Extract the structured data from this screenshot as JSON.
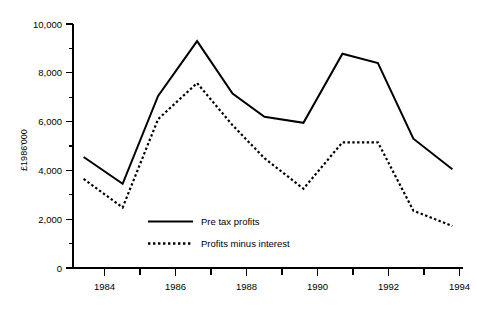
{
  "chart_data": {
    "type": "line",
    "title": "",
    "subtitle": "",
    "xlabel": "",
    "ylabel": "£1986'000",
    "xlim": [
      1983.2,
      1994.2
    ],
    "ylim": [
      0,
      10000
    ],
    "grid": false,
    "legend_position": "inside-lower-left",
    "x_tick_labels": [
      "1984",
      "1986",
      "1988",
      "1990",
      "1992",
      "1994"
    ],
    "x_tick_values": [
      1984,
      1986,
      1988,
      1990,
      1992,
      1994
    ],
    "x_minor_tick_values": [
      1985,
      1987,
      1989,
      1991,
      1993
    ],
    "y_tick_labels": [
      "0",
      "2,000",
      "4,000",
      "6,000",
      "8,000",
      "10,000"
    ],
    "y_tick_values": [
      0,
      2000,
      4000,
      6000,
      8000,
      10000
    ],
    "y_minor_tick_values": [
      1000,
      3000,
      5000,
      7000,
      9000
    ],
    "x": [
      1983.5,
      1984.6,
      1985.6,
      1986.7,
      1987.7,
      1988.6,
      1989.7,
      1990.8,
      1991.8,
      1992.8,
      1993.9
    ],
    "series": [
      {
        "name": "Pre tax profits",
        "style": "solid",
        "values": [
          4550,
          3450,
          7050,
          9300,
          7150,
          6200,
          5950,
          8780,
          8400,
          5300,
          4050
        ]
      },
      {
        "name": "Profits minus interest",
        "style": "dotted",
        "values": [
          3650,
          2480,
          6100,
          7580,
          5850,
          4500,
          3250,
          5150,
          5150,
          2350,
          1720
        ]
      }
    ]
  },
  "legend": {
    "items": [
      {
        "label": "Pre tax profits",
        "style": "solid"
      },
      {
        "label": "Profits minus interest",
        "style": "dotted"
      }
    ]
  },
  "axes": {
    "y_axis_title": "£1986'000"
  }
}
